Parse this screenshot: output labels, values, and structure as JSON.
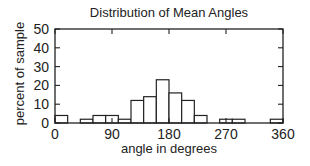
{
  "chart_data": {
    "type": "bar",
    "title": "Distribution of Mean Angles",
    "xlabel": "angle in degrees",
    "ylabel": "percent of sample",
    "xlim": [
      0,
      360
    ],
    "ylim": [
      0,
      50
    ],
    "xticks": [
      0,
      90,
      180,
      270,
      360
    ],
    "yticks": [
      0,
      10,
      20,
      30,
      40,
      50
    ],
    "bin_width": 20,
    "categories": [
      "0-20",
      "20-40",
      "40-60",
      "60-80",
      "80-100",
      "100-120",
      "120-140",
      "140-160",
      "160-180",
      "180-200",
      "200-220",
      "220-240",
      "240-260",
      "260-280",
      "280-300",
      "300-320",
      "320-340",
      "340-360"
    ],
    "values": [
      4,
      0,
      2,
      4,
      4,
      2,
      12,
      14,
      23,
      16,
      12,
      4,
      0,
      2,
      2,
      0,
      0,
      2
    ],
    "grid": false,
    "legend": null
  }
}
